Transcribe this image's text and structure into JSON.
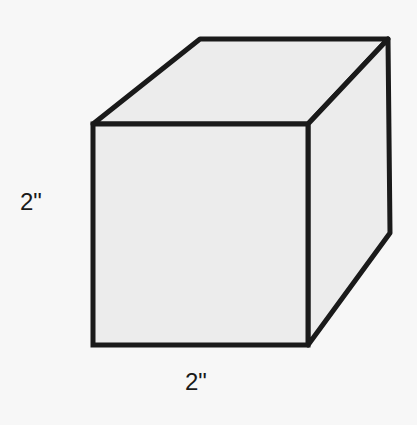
{
  "diagram": {
    "type": "cube",
    "labels": {
      "height": "2\"",
      "width": "2\""
    },
    "colors": {
      "background": "#f7f7f7",
      "face_fill": "#ececec",
      "stroke": "#1a1a1a"
    }
  }
}
